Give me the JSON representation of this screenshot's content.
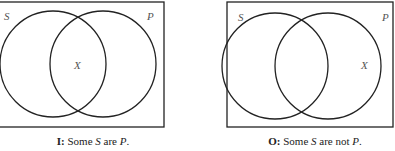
{
  "diagrams": [
    {
      "id": "I",
      "labels": {
        "s": "S",
        "p": "P",
        "x": "X"
      },
      "x_region": "intersection",
      "caption": {
        "prefix": "I:",
        "text1": " Some ",
        "s": "S",
        "text2": " are ",
        "p": "P",
        "end": "."
      }
    },
    {
      "id": "O",
      "labels": {
        "s": "S",
        "p": "P",
        "x": "X"
      },
      "x_region": "P-only",
      "caption": {
        "prefix": "O:",
        "text1": " Some ",
        "s": "S",
        "text2": " are not ",
        "p": "P",
        "end": "."
      }
    }
  ]
}
